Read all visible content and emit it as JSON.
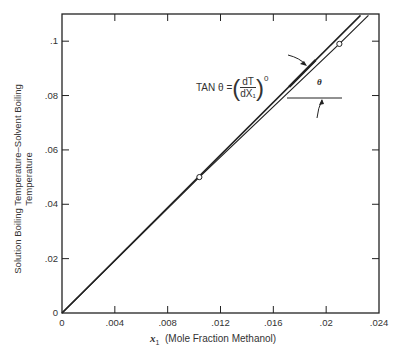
{
  "chart_data": {
    "type": "line",
    "title": "",
    "xlabel": "x1 (Mole Fraction Methanol)",
    "ylabel": "Solution Boiling Temperature–Solvent Boiling Temperature",
    "xlim": [
      0,
      0.024
    ],
    "ylim": [
      0,
      0.11
    ],
    "x_ticks": [
      "0",
      ".004",
      ".008",
      ".012",
      ".016",
      ".02",
      ".024"
    ],
    "y_ticks": [
      "0",
      ".02",
      ".04",
      ".06",
      ".08",
      ".1"
    ],
    "grid": false,
    "legend": null,
    "series": [
      {
        "name": "tangent line (initial slope)",
        "style": "straight",
        "x": [
          0,
          0.0226
        ],
        "y": [
          0,
          0.1095
        ]
      },
      {
        "name": "measured curve",
        "style": "curve",
        "x": [
          0,
          0.0104,
          0.021,
          0.0232
        ],
        "y": [
          0,
          0.05,
          0.099,
          0.1095
        ]
      }
    ],
    "markers": [
      {
        "x": 0.0104,
        "y": 0.05,
        "shape": "open-circle"
      },
      {
        "x": 0.021,
        "y": 0.099,
        "shape": "open-circle"
      }
    ],
    "annotations": [
      {
        "text": "TAN θ = (dT/dX1)°",
        "type": "equation"
      },
      {
        "text": "θ",
        "type": "angle-label"
      }
    ]
  },
  "labels": {
    "ytitle_line1": "Solution Boiling Temperature–Solvent Boiling",
    "ytitle_line2": "Temperature",
    "xtitle_var": "x",
    "xtitle_sub": "1",
    "xtitle_text": "(Mole Fraction Methanol)",
    "tan_prefix": "TAN θ =",
    "frac_num": "dT",
    "frac_den": "dX₁",
    "superscript": "0",
    "theta": "θ"
  }
}
